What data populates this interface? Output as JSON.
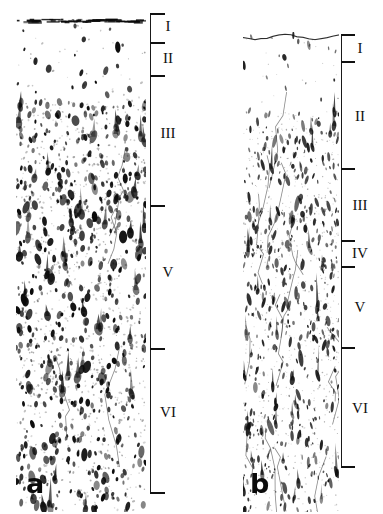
{
  "figure": {
    "background_color": "#ffffff",
    "ink_color": "#111111",
    "width": 383,
    "height": 514
  },
  "panels": [
    {
      "id": "panel-a",
      "letter": "a",
      "description": "Dense dark blob-like stained somata, heavy punctate texture",
      "image": {
        "left": 16,
        "top": 18,
        "width": 130,
        "height": 494
      },
      "pial_surface": {
        "style": "dark-band",
        "top": 2
      },
      "axis": {
        "x": 150,
        "top": 13,
        "bottom": 492
      },
      "texture": {
        "seed": 1347,
        "blob_count": 900,
        "min_size": 1.2,
        "max_size": 5.6,
        "elongation": 1.6,
        "darkness": 0.92,
        "band_densities": [
          0.18,
          0.95,
          1.0,
          0.82,
          0.88,
          0.72
        ]
      },
      "ticks": [
        {
          "y": 13,
          "length": 15
        },
        {
          "y": 42,
          "length": 15
        },
        {
          "y": 75,
          "length": 15
        },
        {
          "y": 205,
          "length": 15
        },
        {
          "y": 348,
          "length": 15
        },
        {
          "y": 492,
          "length": 15
        }
      ],
      "labels": [
        {
          "text": "I",
          "x": 168,
          "y": 26
        },
        {
          "text": "II",
          "x": 168,
          "y": 58
        },
        {
          "text": "III",
          "x": 168,
          "y": 133
        },
        {
          "text": "V",
          "x": 168,
          "y": 272
        },
        {
          "text": "VI",
          "x": 168,
          "y": 412
        }
      ],
      "letter_pos": {
        "x": 26,
        "y": 470
      }
    },
    {
      "id": "panel-b",
      "letter": "b",
      "description": "Sparser fine elongated fibre-like marks with unstained vessel outlines",
      "image": {
        "left": 243,
        "top": 32,
        "width": 96,
        "height": 480
      },
      "pial_surface": {
        "style": "wavy-line",
        "top": 3
      },
      "axis": {
        "x": 341,
        "top": 34,
        "bottom": 466
      },
      "texture": {
        "seed": 8821,
        "blob_count": 760,
        "min_size": 0.8,
        "max_size": 3.6,
        "elongation": 2.8,
        "darkness": 0.78,
        "band_densities": [
          0.12,
          0.7,
          0.95,
          0.85,
          0.78,
          0.6
        ]
      },
      "ticks": [
        {
          "y": 34,
          "length": 14
        },
        {
          "y": 61,
          "length": 14
        },
        {
          "y": 168,
          "length": 14
        },
        {
          "y": 240,
          "length": 14
        },
        {
          "y": 266,
          "length": 14
        },
        {
          "y": 347,
          "length": 14
        },
        {
          "y": 466,
          "length": 14
        }
      ],
      "labels": [
        {
          "text": "I",
          "x": 360,
          "y": 48
        },
        {
          "text": "II",
          "x": 360,
          "y": 116
        },
        {
          "text": "III",
          "x": 360,
          "y": 205
        },
        {
          "text": "IV",
          "x": 360,
          "y": 253
        },
        {
          "text": "V",
          "x": 360,
          "y": 307
        },
        {
          "text": "VI",
          "x": 360,
          "y": 408
        }
      ],
      "letter_pos": {
        "x": 250,
        "y": 470
      }
    }
  ]
}
